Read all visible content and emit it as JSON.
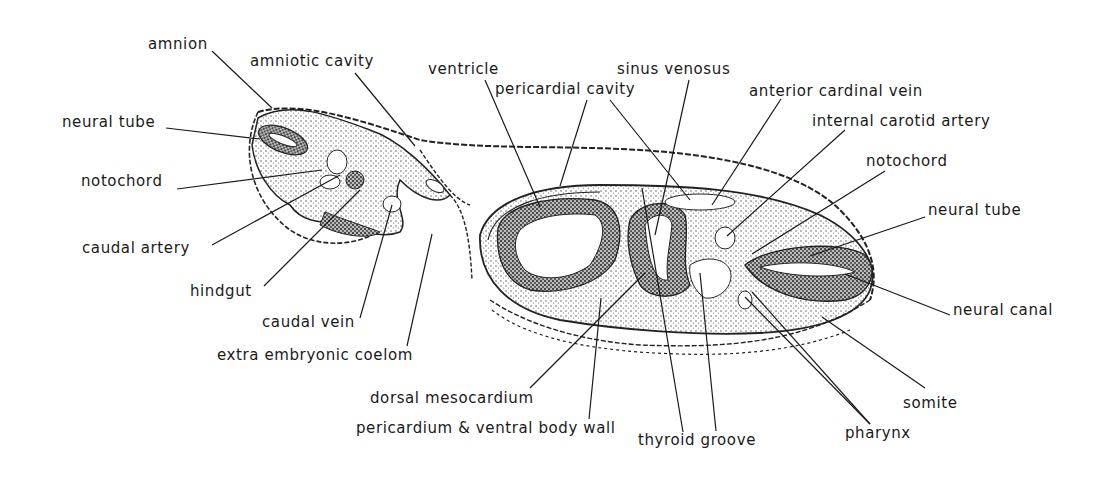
{
  "figure": {
    "ink_color": "#1a1a1a",
    "background": "#ffffff",
    "stipple_color": "#555555"
  },
  "labels": [
    {
      "id": "amnion",
      "text": "amnion",
      "x": 148,
      "y": 36,
      "line": [
        212,
        51,
        272,
        108
      ]
    },
    {
      "id": "amniotic-cavity",
      "text": "amniotic cavity",
      "x": 250,
      "y": 53,
      "line": [
        355,
        73,
        415,
        146
      ]
    },
    {
      "id": "neural-tube-left",
      "text": "neural tube",
      "x": 62,
      "y": 114,
      "line": [
        166,
        128,
        260,
        139
      ]
    },
    {
      "id": "notochord-left",
      "text": "notochord",
      "x": 81,
      "y": 173,
      "line": [
        177,
        189,
        322,
        170
      ]
    },
    {
      "id": "caudal-artery",
      "text": "caudal artery",
      "x": 82,
      "y": 240,
      "line": [
        212,
        245,
        340,
        175
      ]
    },
    {
      "id": "hindgut",
      "text": "hindgut",
      "x": 190,
      "y": 283,
      "line": [
        264,
        286,
        360,
        190
      ]
    },
    {
      "id": "caudal-vein",
      "text": "caudal vein",
      "x": 262,
      "y": 314,
      "line": [
        360,
        318,
        392,
        205
      ]
    },
    {
      "id": "extraembryonic-coelom",
      "text": "extra embryonic coelom",
      "x": 217,
      "y": 347,
      "line": [
        407,
        346,
        432,
        234
      ]
    },
    {
      "id": "ventricle",
      "text": "ventricle",
      "x": 428,
      "y": 61,
      "line": [
        485,
        80,
        540,
        207
      ]
    },
    {
      "id": "pericardial-cavity",
      "text": "pericardial cavity",
      "x": 495,
      "y": 81,
      "line": [
        587,
        100,
        560,
        186
      ]
    },
    {
      "id": "sinus-venosus",
      "text": "sinus venosus",
      "x": 617,
      "y": 61,
      "line": [
        689,
        80,
        655,
        235
      ]
    },
    {
      "id": "anterior-cardinal-vein",
      "text": "anterior cardinal vein",
      "x": 749,
      "y": 83,
      "line": [
        781,
        99,
        712,
        205
      ]
    },
    {
      "id": "internal-carotid-artery",
      "text": "internal carotid artery",
      "x": 812,
      "y": 113,
      "line": [
        845,
        130,
        727,
        236
      ]
    },
    {
      "id": "notochord-right",
      "text": "notochord",
      "x": 866,
      "y": 153,
      "line": [
        885,
        171,
        752,
        254
      ]
    },
    {
      "id": "neural-tube-right",
      "text": "neural tube",
      "x": 928,
      "y": 202,
      "line": [
        925,
        217,
        810,
        256
      ]
    },
    {
      "id": "neural-canal",
      "text": "neural canal",
      "x": 953,
      "y": 302,
      "line": [
        950,
        315,
        845,
        274
      ]
    },
    {
      "id": "somite",
      "text": "somite",
      "x": 903,
      "y": 395,
      "line": [
        925,
        388,
        822,
        317
      ]
    },
    {
      "id": "pharynx",
      "text": "pharynx",
      "x": 845,
      "y": 425,
      "line": [
        870,
        424,
        752,
        292
      ]
    },
    {
      "id": "thyroid-groove",
      "text": "thyroid groove",
      "x": 638,
      "y": 432,
      "line": [
        683,
        432,
        642,
        188
      ]
    },
    {
      "id": "pericardium-ventral-body-wall",
      "text": "pericardium & ventral body wall",
      "x": 356,
      "y": 420,
      "line": [
        589,
        419,
        601,
        298
      ]
    },
    {
      "id": "dorsal-mesocardium",
      "text": "dorsal mesocardium",
      "x": 370,
      "y": 390,
      "line": [
        530,
        388,
        645,
        273
      ]
    },
    {
      "id": "pharynx-line2",
      "text": "",
      "x": 0,
      "y": 0,
      "line": [
        870,
        424,
        745,
        297
      ]
    },
    {
      "id": "pericardial-cavity-line2",
      "text": "",
      "x": 0,
      "y": 0,
      "line": [
        610,
        100,
        690,
        200
      ]
    },
    {
      "id": "thyroid-line",
      "text": "",
      "x": 0,
      "y": 0,
      "line": [
        716,
        431,
        700,
        273
      ]
    }
  ]
}
